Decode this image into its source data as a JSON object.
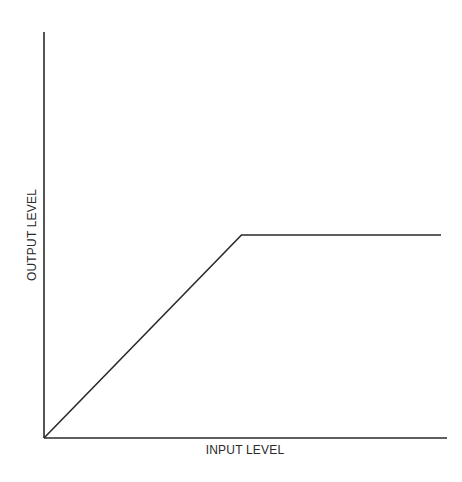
{
  "chart_data": {
    "type": "line",
    "title": "",
    "xlabel": "INPUT LEVEL",
    "ylabel": "OUTPUT LEVEL",
    "grid": false,
    "legend": null,
    "x": [
      0,
      0.49,
      0.985
    ],
    "series": [
      {
        "name": "limiter transfer curve",
        "values": [
          0,
          0.5,
          0.5
        ]
      }
    ],
    "xlim": [
      0,
      1
    ],
    "ylim": [
      0,
      1
    ],
    "annotations": []
  },
  "colors": {
    "line": "#2a2a2a",
    "axis": "#2a2a2a",
    "background": "#ffffff"
  }
}
